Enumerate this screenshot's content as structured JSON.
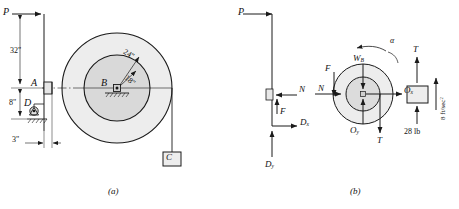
{
  "figure": {
    "type": "engineering-mechanics-free-body-diagram",
    "caption_a": "(a)",
    "caption_b": "(b)"
  },
  "part_a": {
    "name": "pictorial-diagram",
    "force_P": "P",
    "dim_32": "32\"",
    "dim_8": "8\"",
    "dim_3": "3\"",
    "point_A": "A",
    "point_B": "B",
    "point_D": "D",
    "block_C": "C",
    "radius_outer": "24\"",
    "radius_inner": "18\"",
    "unit_mark": "\""
  },
  "part_b": {
    "name": "free-body-diagrams",
    "bar_fbd": {
      "force_P": "P",
      "normal_N": "N",
      "friction_F": "F",
      "reaction_Dx": "D",
      "reaction_Dx_sub": "x",
      "reaction_Dy": "D",
      "reaction_Dy_sub": "y"
    },
    "wheel_fbd": {
      "weight_W": "W",
      "weight_W_sub": "B",
      "friction_F": "F",
      "normal_N": "N",
      "pin_Ox": "O",
      "pin_Ox_sub": "x",
      "pin_Oy": "O",
      "pin_Oy_sub": "y",
      "tension_T": "T",
      "alpha": "α"
    },
    "block_fbd": {
      "tension_T": "T",
      "weight": "28 lb",
      "acceleration": "8 ft/sec",
      "accel_exponent": "2"
    }
  },
  "colors": {
    "ink": "#1a1a1a",
    "fill_light": "#e8e8e8",
    "fill_mid": "#dcdcdc",
    "paper": "#ffffff"
  }
}
